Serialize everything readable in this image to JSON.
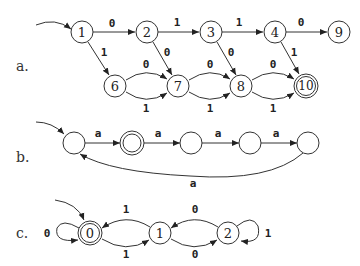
{
  "diagrams": {
    "a": {
      "label": "a.",
      "nodes": [
        "1",
        "2",
        "3",
        "4",
        "9",
        "6",
        "7",
        "8",
        "10"
      ],
      "start": "1",
      "accepting": [
        "10"
      ],
      "edges": [
        {
          "from": "1",
          "to": "2",
          "label": "0"
        },
        {
          "from": "2",
          "to": "3",
          "label": "1"
        },
        {
          "from": "3",
          "to": "4",
          "label": "1"
        },
        {
          "from": "4",
          "to": "9",
          "label": "0"
        },
        {
          "from": "1",
          "to": "6",
          "label": "1"
        },
        {
          "from": "2",
          "to": "7",
          "label": "0"
        },
        {
          "from": "3",
          "to": "8",
          "label": "0"
        },
        {
          "from": "4",
          "to": "10",
          "label": "1"
        },
        {
          "from": "6",
          "to": "7",
          "label": "0"
        },
        {
          "from": "6",
          "to": "7",
          "label": "1"
        },
        {
          "from": "7",
          "to": "8",
          "label": "0"
        },
        {
          "from": "7",
          "to": "8",
          "label": "1"
        },
        {
          "from": "8",
          "to": "10",
          "label": "0"
        },
        {
          "from": "8",
          "to": "10",
          "label": "1"
        }
      ]
    },
    "b": {
      "label": "b.",
      "edge_labels": [
        "a",
        "a",
        "a",
        "a",
        "a"
      ]
    },
    "c": {
      "label": "c.",
      "nodes": [
        "0",
        "1",
        "2"
      ],
      "edge_labels": {
        "loop0": "0",
        "top01": "1",
        "bot01": "1",
        "top12": "0",
        "bot12": "0",
        "loop2": "1"
      }
    }
  }
}
